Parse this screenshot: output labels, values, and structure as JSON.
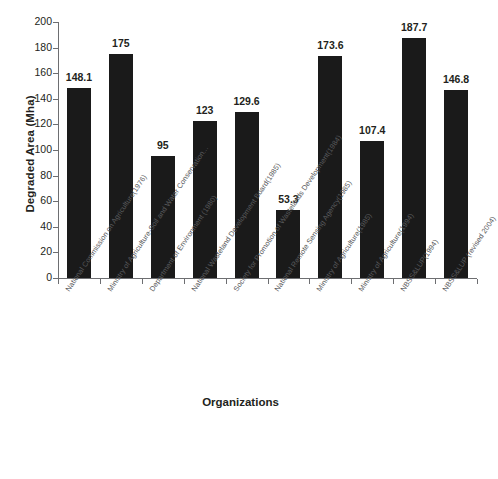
{
  "chart_data": {
    "type": "bar",
    "title": "",
    "xlabel": "Organizations",
    "ylabel": "Degraded Area (Mha)",
    "ylim": [
      0,
      200
    ],
    "ytick_step": 20,
    "yticks": [
      0,
      20,
      40,
      60,
      80,
      100,
      120,
      140,
      160,
      180,
      200
    ],
    "ytick_labels": [
      "0",
      "20",
      "40",
      "60",
      "80",
      "100",
      "120",
      "140",
      "160",
      "180",
      "200"
    ],
    "grid": false,
    "legend": false,
    "bar_color": "#1a1a1a",
    "categories": [
      "National Commission on Agriculture(1976)",
      "Ministry of Agriculture-Soil and  Water Conservation...",
      "Department of Environment (1980)",
      "National Wasteland Development Board(1985)",
      "Society  for Promotion of  Wastelands Development(1984)",
      "National Remote Sensing Agency(1985)",
      "Ministry of Agriculture(1985)",
      "Ministry of Agriculture(1994)",
      "NBSS&LUP(1994)",
      "NBSS&LUP (revised 2004)"
    ],
    "values": [
      148.1,
      175,
      95,
      123,
      129.6,
      53.3,
      173.6,
      107.4,
      187.7,
      146.8
    ],
    "data_labels": [
      "148.1",
      "175",
      "95",
      "123",
      "129.6",
      "53.3",
      "173.6",
      "107.4",
      "187.7",
      "146.8"
    ]
  }
}
